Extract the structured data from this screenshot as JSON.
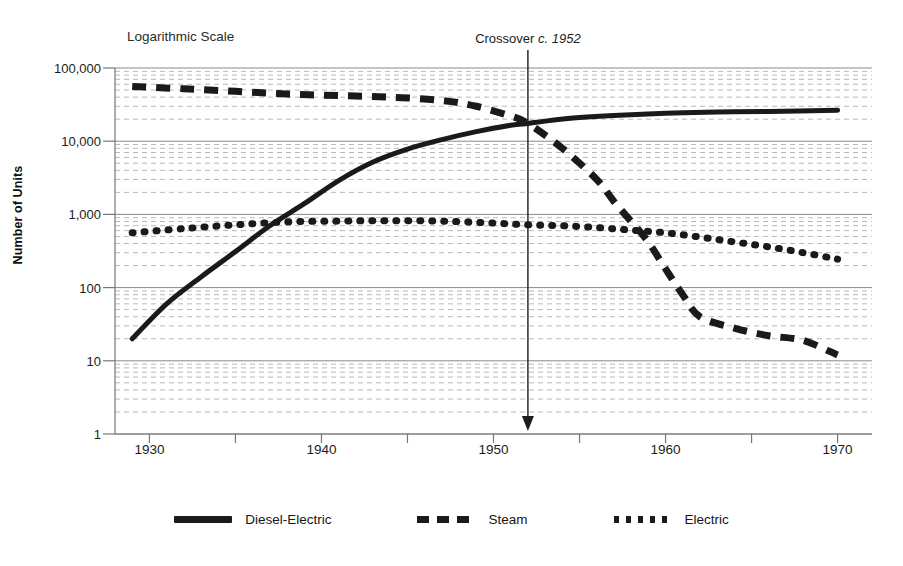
{
  "chart_data": {
    "type": "line",
    "title": "",
    "subtitle": "",
    "scale_note": "Logarithmic Scale",
    "xlabel": "",
    "ylabel": "Number of Units",
    "yscale": "log",
    "ylim": [
      1,
      100000
    ],
    "xlim": [
      1928,
      1972
    ],
    "grid": true,
    "grid_minor": true,
    "legend_position": "bottom",
    "y_ticks": [
      {
        "value": 100000,
        "label": "100,000"
      },
      {
        "value": 10000,
        "label": "10,000"
      },
      {
        "value": 1000,
        "label": "1,000"
      },
      {
        "value": 100,
        "label": "100"
      },
      {
        "value": 10,
        "label": "10"
      },
      {
        "value": 1,
        "label": "1"
      }
    ],
    "x_ticks": [
      {
        "value": 1930,
        "label": "1930"
      },
      {
        "value": 1935,
        "label": ""
      },
      {
        "value": 1940,
        "label": "1940"
      },
      {
        "value": 1945,
        "label": ""
      },
      {
        "value": 1950,
        "label": "1950"
      },
      {
        "value": 1955,
        "label": ""
      },
      {
        "value": 1960,
        "label": "1960"
      },
      {
        "value": 1965,
        "label": ""
      },
      {
        "value": 1970,
        "label": "1970"
      }
    ],
    "annotations": [
      {
        "name": "crossover",
        "text_prefix": "Crossover ",
        "text_emph": "c. 1952",
        "x": 1952,
        "y_from": 100000,
        "y_to": 1,
        "arrow": true
      }
    ],
    "series": [
      {
        "name": "Diesel-Electric",
        "style": "solid",
        "color": "#1a1a1a",
        "x": [
          1929,
          1931,
          1933,
          1935,
          1937,
          1939,
          1941,
          1943,
          1945,
          1947,
          1949,
          1951,
          1952,
          1953,
          1955,
          1957,
          1960,
          1963,
          1966,
          1970
        ],
        "values": [
          20,
          60,
          140,
          310,
          700,
          1400,
          2900,
          5200,
          7800,
          10500,
          13500,
          16500,
          17500,
          18800,
          21000,
          22500,
          24000,
          25000,
          25500,
          26500
        ]
      },
      {
        "name": "Steam",
        "style": "dashed",
        "color": "#1a1a1a",
        "x": [
          1929,
          1932,
          1935,
          1938,
          1941,
          1944,
          1947,
          1949,
          1951,
          1952,
          1954,
          1956,
          1957,
          1958,
          1959,
          1960,
          1961,
          1962,
          1964,
          1966,
          1968,
          1970
        ],
        "values": [
          56000,
          52000,
          48000,
          44000,
          42000,
          40000,
          36000,
          30000,
          22000,
          17500,
          8000,
          3000,
          1500,
          800,
          420,
          180,
          80,
          40,
          28,
          22,
          19,
          12
        ]
      },
      {
        "name": "Electric",
        "style": "dotted",
        "color": "#1a1a1a",
        "x": [
          1929,
          1932,
          1935,
          1938,
          1941,
          1944,
          1947,
          1950,
          1952,
          1954,
          1956,
          1958,
          1960,
          1962,
          1964,
          1966,
          1968,
          1970
        ],
        "values": [
          560,
          640,
          720,
          790,
          810,
          820,
          810,
          760,
          720,
          700,
          660,
          610,
          560,
          490,
          420,
          360,
          300,
          245
        ]
      }
    ]
  },
  "legend": {
    "items": [
      {
        "label": "Diesel-Electric",
        "style": "solid"
      },
      {
        "label": "Steam",
        "style": "dashed"
      },
      {
        "label": "Electric",
        "style": "dotted"
      }
    ]
  }
}
